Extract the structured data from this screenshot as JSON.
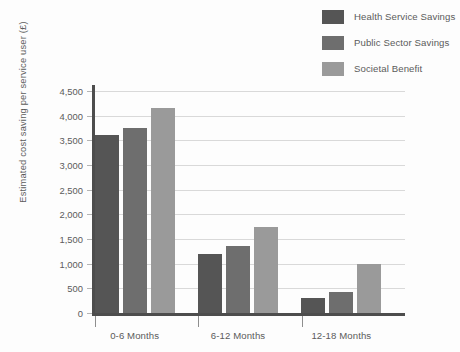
{
  "chart_data": {
    "type": "bar",
    "title": "",
    "xlabel": "",
    "ylabel": "Estimated cost saving per service user (£)",
    "ylim": [
      0,
      4500
    ],
    "ytick_step": 500,
    "grid": true,
    "legend_position": "top-right",
    "categories": [
      "0-6 Months",
      "6-12 Months",
      "12-18 Months"
    ],
    "ytick_labels": [
      "0",
      "500",
      "1,000",
      "1,500",
      "2,000",
      "2,500",
      "3,000",
      "3,500",
      "4,000",
      "4,500"
    ],
    "ytick_values": [
      0,
      500,
      1000,
      1500,
      2000,
      2500,
      3000,
      3500,
      4000,
      4500
    ],
    "series": [
      {
        "name": "Health Service Savings",
        "color": "#555555",
        "values": [
          3600,
          1200,
          300
        ]
      },
      {
        "name": "Public Sector Savings",
        "color": "#6e6e6e",
        "values": [
          3750,
          1350,
          430
        ]
      },
      {
        "name": "Societal Benefit",
        "color": "#9a9a9a",
        "values": [
          4150,
          1750,
          1000
        ]
      }
    ]
  }
}
